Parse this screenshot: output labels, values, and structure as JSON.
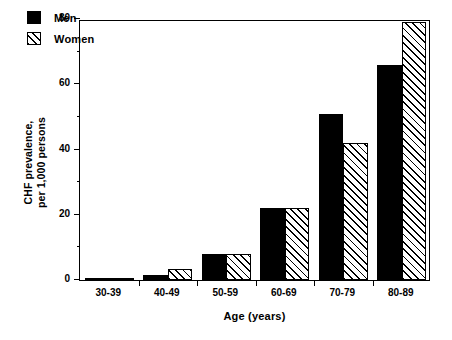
{
  "chart_data": {
    "type": "bar",
    "title": "",
    "xlabel": "Age (years)",
    "ylabel_line1": "CHF prevalence,",
    "ylabel_line2": "per 1,000 persons",
    "categories": [
      "30-39",
      "40-49",
      "50-59",
      "60-69",
      "70-79",
      "80-89"
    ],
    "series": [
      {
        "name": "Men",
        "values": [
          0.2,
          1.5,
          8,
          22,
          51,
          66
        ]
      },
      {
        "name": "Women",
        "values": [
          0.2,
          3.5,
          8,
          22,
          42,
          79
        ]
      }
    ],
    "ylim": [
      0,
      80
    ],
    "yticks": [
      0,
      20,
      40,
      60,
      80
    ],
    "yticks_minor": [
      10,
      30,
      50,
      70
    ],
    "ytick_labels": [
      "0",
      "20",
      "40",
      "60",
      "80"
    ],
    "grid": false,
    "legend_position": "top-left",
    "colors": {
      "men": "#000000",
      "women_fill": "#ffffff",
      "women_hatch": "#000000",
      "axis": "#000000",
      "background": "#ffffff"
    }
  },
  "legend": {
    "items": [
      {
        "label": "Men",
        "swatch": "solid-black-square"
      },
      {
        "label": "Women",
        "swatch": "hatched-square"
      }
    ]
  }
}
